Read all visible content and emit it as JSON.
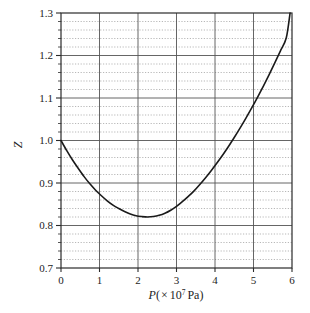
{
  "chart_data": {
    "type": "line",
    "title": "",
    "subtitle": "",
    "xlabel_parts": {
      "symbol": "P",
      "open": "(",
      "times": "×",
      "mantissa": "10",
      "exponent": "7",
      "unit": "Pa",
      "close": ")"
    },
    "xlabel": "P(× 10⁷ Pa)",
    "ylabel": "Z",
    "xlim": [
      0,
      6
    ],
    "ylim": [
      0.7,
      1.3
    ],
    "xticks": [
      "0",
      "1",
      "2",
      "3",
      "4",
      "5",
      "6"
    ],
    "xtick_values": [
      0,
      1,
      2,
      3,
      4,
      5,
      6
    ],
    "yticks": [
      "0.7",
      "0.8",
      "0.9",
      "1.0",
      "1.1",
      "1.2",
      "1.3"
    ],
    "ytick_values": [
      0.7,
      0.8,
      0.9,
      1.0,
      1.1,
      1.2,
      1.3
    ],
    "y_minor_step": 0.02,
    "grid": {
      "major_horizontal": true,
      "minor_horizontal": true,
      "major_vertical": true,
      "minor_vertical": false,
      "major_color": "#555555",
      "minor_color": "#9a9a9a",
      "minor_style": "dotted"
    },
    "legend": null,
    "legend_position": "none",
    "annotations": [],
    "series": [
      {
        "name": "Z",
        "color": "#1a1a1a",
        "width": 1.6,
        "x": [
          0.0,
          0.15,
          0.3,
          0.45,
          0.6,
          0.75,
          0.9,
          1.05,
          1.2,
          1.35,
          1.5,
          1.65,
          1.8,
          1.95,
          2.1,
          2.25,
          2.4,
          2.55,
          2.7,
          2.85,
          3.0,
          3.15,
          3.3,
          3.45,
          3.6,
          3.75,
          3.9,
          4.05,
          4.2,
          4.35,
          4.5,
          4.65,
          4.8,
          4.95,
          5.1,
          5.25,
          5.4,
          5.55,
          5.7,
          5.85,
          5.95
        ],
        "y": [
          1.0,
          0.976,
          0.954,
          0.934,
          0.915,
          0.898,
          0.883,
          0.87,
          0.858,
          0.848,
          0.84,
          0.833,
          0.827,
          0.823,
          0.821,
          0.82,
          0.821,
          0.824,
          0.829,
          0.836,
          0.845,
          0.856,
          0.868,
          0.881,
          0.896,
          0.912,
          0.929,
          0.947,
          0.966,
          0.986,
          1.007,
          1.029,
          1.052,
          1.076,
          1.101,
          1.127,
          1.154,
          1.182,
          1.211,
          1.241,
          1.3
        ],
        "key_points": {
          "start": {
            "P": 0.0,
            "Z": 1.0
          },
          "minimum": {
            "P": 1.7,
            "Z": 0.818
          },
          "unity_crossing": {
            "P": 3.65,
            "Z": 1.0
          },
          "end": {
            "P": 5.95,
            "Z": 1.3
          }
        }
      }
    ]
  }
}
